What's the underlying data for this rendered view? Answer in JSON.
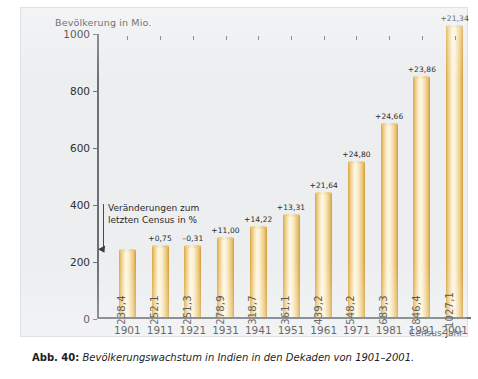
{
  "figure": {
    "caption_label": "Abb. 40:",
    "caption_text": "Bevölkerungswachstum in Indien in den Dekaden von 1901–2001.",
    "source": "Quelle: Census of India 2001; Series 1, Paper 1",
    "annotation": {
      "line1": "Veränderungen zum",
      "line2": "letzten Census in %"
    }
  },
  "chart_data": {
    "type": "bar",
    "title": "Bevölkerungswachstum in Indien in den Dekaden von 1901–2001.",
    "ylabel": "Bevölkerung in Mio.",
    "xlabel": "Census-Jahr",
    "ylim": [
      0,
      1000
    ],
    "yticks": [
      "0",
      "200",
      "400",
      "600",
      "800",
      "1000"
    ],
    "ytick_values": [
      0,
      200,
      400,
      600,
      800,
      1000
    ],
    "grid": false,
    "legend": "none",
    "categories": [
      "1901",
      "1911",
      "1921",
      "1931",
      "1941",
      "1951",
      "1961",
      "1971",
      "1981",
      "1991",
      "2001"
    ],
    "values": [
      238.4,
      252.1,
      251.3,
      278.9,
      318.7,
      361.1,
      439.2,
      548.2,
      683.3,
      846.4,
      1027.1
    ],
    "value_labels": [
      "238,4",
      "252,1",
      "251,3",
      "278,9",
      "318,7",
      "361,1",
      "439,2",
      "548,2",
      "683,3",
      "846,4",
      "1027,1"
    ],
    "pct_change_labels": [
      "",
      "+0,75",
      "–0,31",
      "+11,00",
      "+14,22",
      "+13,31",
      "+21,64",
      "+24,80",
      "+24,66",
      "+23,86",
      "+21,34"
    ],
    "pct_change_values": [
      null,
      0.75,
      -0.31,
      11.0,
      14.22,
      13.31,
      21.64,
      24.8,
      24.66,
      23.86,
      21.34
    ],
    "bar_color": "#f2d79a",
    "axis_color": "#6d7176",
    "panel_color": "#eceef0"
  }
}
